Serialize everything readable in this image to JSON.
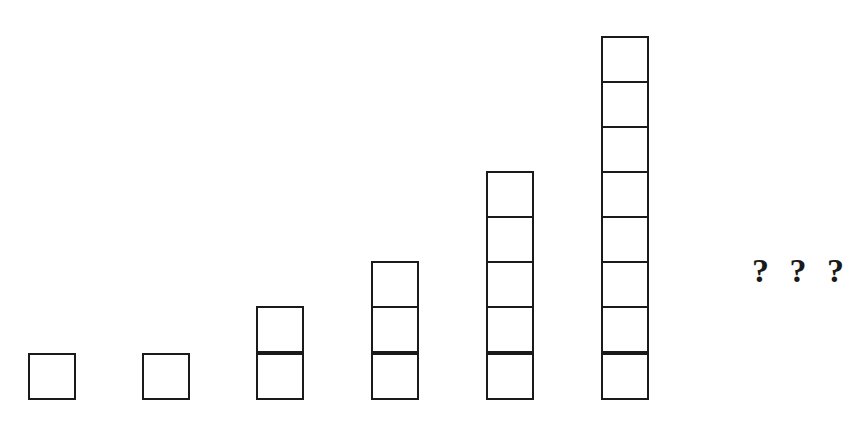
{
  "diagram": {
    "type": "stacked-squares-sequence",
    "baseline_y": 400,
    "block_size": 47,
    "columns": [
      {
        "index": 1,
        "count": 1,
        "x": 28
      },
      {
        "index": 2,
        "count": 1,
        "x": 142
      },
      {
        "index": 3,
        "count": 2,
        "x": 256
      },
      {
        "index": 4,
        "count": 3,
        "x": 371
      },
      {
        "index": 5,
        "count": 5,
        "x": 486
      },
      {
        "index": 6,
        "count": 8,
        "x": 601
      }
    ],
    "unknown_label": "? ? ?",
    "colors": {
      "stroke": "#1a1a1a",
      "fill": "#ffffff",
      "background": "#ffffff"
    }
  }
}
